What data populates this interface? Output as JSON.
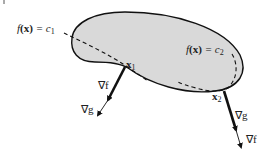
{
  "diagram": {
    "region_fill": "#d9d9d9",
    "stroke_color": "#111111",
    "labels": {
      "level1": {
        "f": "f",
        "x": "(x)",
        "eq": " = c",
        "sub": "1"
      },
      "level2": {
        "f": "f",
        "x": "(x)",
        "eq": " = c",
        "sub": "2"
      },
      "point1": {
        "main": "x",
        "sub": "1"
      },
      "point2": {
        "main": "x",
        "sub": "2"
      },
      "grad_f_1": "∇f",
      "grad_g_1": "∇g",
      "grad_g_2": "∇g",
      "grad_f_2": "∇f"
    }
  }
}
